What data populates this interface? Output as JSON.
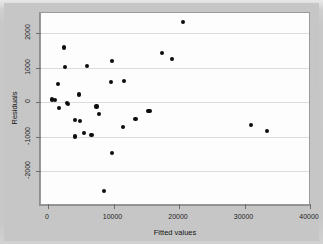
{
  "chart_data": {
    "type": "scatter",
    "title": "",
    "xlabel": "Fitted values",
    "ylabel": "Residuals",
    "xlim": [
      0,
      40000
    ],
    "ylim": [
      -2700,
      2450
    ],
    "xticks": [
      0,
      10000,
      20000,
      30000,
      40000
    ],
    "xticklabels": [
      "0",
      "10000",
      "20000",
      "30000",
      "40000"
    ],
    "yticks": [
      2000,
      1000,
      0,
      -1000,
      -2000
    ],
    "yticklabels": [
      "2000",
      "1000",
      "0",
      "-1000",
      "-2000"
    ],
    "grid": true,
    "grid_axis": "y",
    "legend": null,
    "marker": "filled-circle",
    "marker_color": "#0c0c0c",
    "plot_background": "#fdfdfd",
    "figure_background": "#c6c6c6",
    "points": [
      {
        "x": 20600,
        "y": 2330
      },
      {
        "x": 2450,
        "y": 1580
      },
      {
        "x": 17450,
        "y": 1420
      },
      {
        "x": 18950,
        "y": 1250
      },
      {
        "x": 9750,
        "y": 1180
      },
      {
        "x": 5950,
        "y": 1050
      },
      {
        "x": 2600,
        "y": 1020
      },
      {
        "x": 11600,
        "y": 620
      },
      {
        "x": 9600,
        "y": 570
      },
      {
        "x": 1500,
        "y": 520
      },
      {
        "x": 4700,
        "y": 220
      },
      {
        "x": 600,
        "y": 70
      },
      {
        "x": 1100,
        "y": 60
      },
      {
        "x": 2900,
        "y": -30
      },
      {
        "x": 3050,
        "y": -50
      },
      {
        "x": 1700,
        "y": -180
      },
      {
        "x": 7400,
        "y": -130
      },
      {
        "x": 15250,
        "y": -250
      },
      {
        "x": 15500,
        "y": -255
      },
      {
        "x": 7800,
        "y": -340
      },
      {
        "x": 13350,
        "y": -500
      },
      {
        "x": 4100,
        "y": -520
      },
      {
        "x": 4900,
        "y": -545
      },
      {
        "x": 30950,
        "y": -660
      },
      {
        "x": 11400,
        "y": -720
      },
      {
        "x": 33450,
        "y": -850
      },
      {
        "x": 5450,
        "y": -900
      },
      {
        "x": 6650,
        "y": -945
      },
      {
        "x": 4150,
        "y": -1000
      },
      {
        "x": 9800,
        "y": -1490
      },
      {
        "x": 8600,
        "y": -2580
      }
    ]
  },
  "axes": {
    "y_title": "Residuals",
    "x_title": "Fitted values"
  }
}
